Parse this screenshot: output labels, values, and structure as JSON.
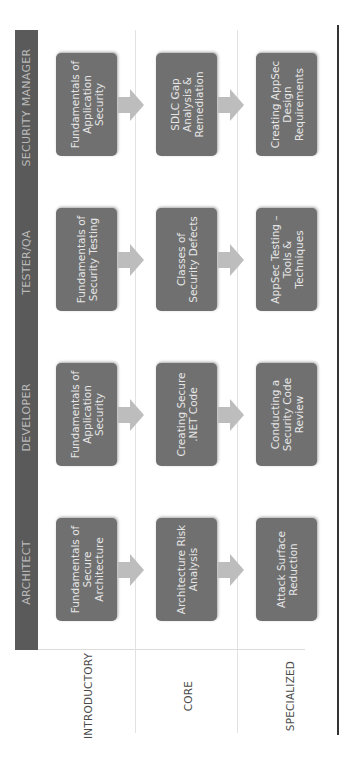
{
  "columns": [
    "ARCHITECT",
    "DEVELOPER",
    "TESTER/QA",
    "SECURITY MANAGER"
  ],
  "rows": [
    "INTRODUCTORY",
    "CORE",
    "SPECIALIZED"
  ],
  "cells": {
    "architect": [
      "Fundamentals of Secure Architecture",
      "Architecture Risk Analysis",
      "Attack Surface Reduction"
    ],
    "developer": [
      "Fundamentals of Application Security",
      "Creating Secure .NET Code",
      "Conducting a Security Code Review"
    ],
    "tester": [
      "Fundamentals of Security Testing",
      "Classes of Security Defects",
      "AppSec Testing – Tools & Techniques"
    ],
    "manager": [
      "Fundamentals of Application Security",
      "SDLC Gap Analysis & Remediation",
      "Creating AppSec Design Requirements"
    ]
  },
  "colors": {
    "header_band": "#5a5a5a",
    "header_text": "#b9b9b9",
    "box_fill": "#707070",
    "box_text": "#e6e6e6",
    "arrow": "#bdbdbd",
    "row_label": "#4a4a4a"
  }
}
